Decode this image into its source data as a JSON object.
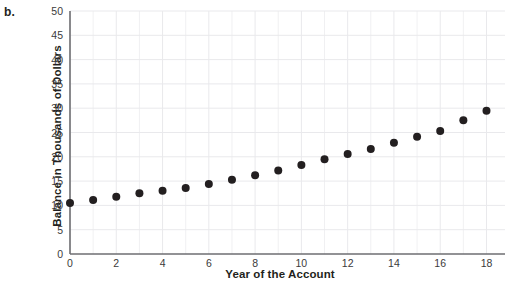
{
  "panel": {
    "letter": "b."
  },
  "chart_data": {
    "type": "scatter",
    "title": "",
    "xlabel": "Year of the Account",
    "ylabel": "Balance in Thousands of Dollars",
    "xlim": [
      0,
      18.8
    ],
    "ylim": [
      0,
      50
    ],
    "xticks": [
      0,
      2,
      4,
      6,
      8,
      10,
      12,
      14,
      16,
      18
    ],
    "yticks": [
      0,
      5,
      10,
      15,
      20,
      25,
      30,
      35,
      40,
      45,
      50
    ],
    "xtick_labels": [
      "0",
      "2",
      "4",
      "6",
      "8",
      "10",
      "12",
      "14",
      "16",
      "18"
    ],
    "ytick_labels": [
      "0",
      "5",
      "10",
      "15",
      "20",
      "25",
      "30",
      "35",
      "40",
      "45",
      "50"
    ],
    "grid": true,
    "minor_x_grid": true,
    "legend": null,
    "marker": "circle",
    "marker_color": "#231f20",
    "marker_size": 4,
    "grid_color": "#e9e9ec",
    "axis_color": "#6e6e72",
    "x": [
      0,
      1,
      2,
      3,
      4,
      5,
      6,
      7,
      8,
      9,
      10,
      11,
      12,
      13,
      14,
      15,
      16,
      17,
      18
    ],
    "values": [
      10.5,
      11.1,
      11.8,
      12.5,
      13.0,
      13.6,
      14.4,
      15.3,
      16.2,
      17.2,
      18.3,
      19.5,
      20.6,
      21.6,
      22.9,
      24.1,
      25.3,
      27.5,
      29.5
    ],
    "points": [
      {
        "x": 0,
        "y": 10.5
      },
      {
        "x": 1,
        "y": 11.1
      },
      {
        "x": 2,
        "y": 11.8
      },
      {
        "x": 3,
        "y": 12.5
      },
      {
        "x": 4,
        "y": 13.0
      },
      {
        "x": 5,
        "y": 13.6
      },
      {
        "x": 6,
        "y": 14.4
      },
      {
        "x": 7,
        "y": 15.3
      },
      {
        "x": 8,
        "y": 16.2
      },
      {
        "x": 9,
        "y": 17.2
      },
      {
        "x": 10,
        "y": 18.3
      },
      {
        "x": 11,
        "y": 19.5
      },
      {
        "x": 12,
        "y": 20.6
      },
      {
        "x": 13,
        "y": 21.6
      },
      {
        "x": 14,
        "y": 22.9
      },
      {
        "x": 15,
        "y": 24.1
      },
      {
        "x": 16,
        "y": 25.3
      },
      {
        "x": 17,
        "y": 27.5
      },
      {
        "x": 18,
        "y": 29.5
      }
    ]
  }
}
